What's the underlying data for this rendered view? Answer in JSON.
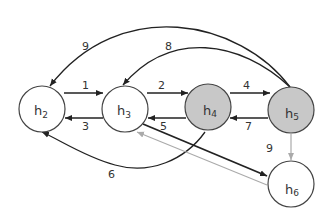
{
  "diagram": {
    "type": "directed-graph",
    "colors": {
      "node_stroke": "#444444",
      "node_fill_default": "#ffffff",
      "node_fill_highlight": "#c8c8c8",
      "edge_dark": "#222222",
      "edge_light": "#aaaaaa"
    },
    "nodes": [
      {
        "id": "h2",
        "base": "h",
        "sub": "2",
        "highlighted": false
      },
      {
        "id": "h3",
        "base": "h",
        "sub": "3",
        "highlighted": false
      },
      {
        "id": "h4",
        "base": "h",
        "sub": "4",
        "highlighted": true
      },
      {
        "id": "h5",
        "base": "h",
        "sub": "5",
        "highlighted": true
      },
      {
        "id": "h6",
        "base": "h",
        "sub": "6",
        "highlighted": false
      }
    ],
    "edges": [
      {
        "from": "h2",
        "to": "h3",
        "label": "1",
        "style": "dark"
      },
      {
        "from": "h3",
        "to": "h4",
        "label": "2",
        "style": "dark"
      },
      {
        "from": "h3",
        "to": "h2",
        "label": "3",
        "style": "dark"
      },
      {
        "from": "h4",
        "to": "h5",
        "label": "4",
        "style": "dark"
      },
      {
        "from": "h4",
        "to": "h3",
        "label": "5",
        "style": "dark"
      },
      {
        "from": "h4",
        "to": "h2",
        "label": "6",
        "style": "dark"
      },
      {
        "from": "h5",
        "to": "h4",
        "label": "7",
        "style": "dark"
      },
      {
        "from": "h5",
        "to": "h3",
        "label": "8",
        "style": "dark"
      },
      {
        "from": "h5",
        "to": "h2",
        "label": "9",
        "style": "dark"
      },
      {
        "from": "h5",
        "to": "h6",
        "label": "9",
        "style": "light"
      },
      {
        "from": "h3",
        "to": "h6",
        "label": "",
        "style": "dark"
      },
      {
        "from": "h6",
        "to": "h3",
        "label": "",
        "style": "light"
      }
    ]
  }
}
